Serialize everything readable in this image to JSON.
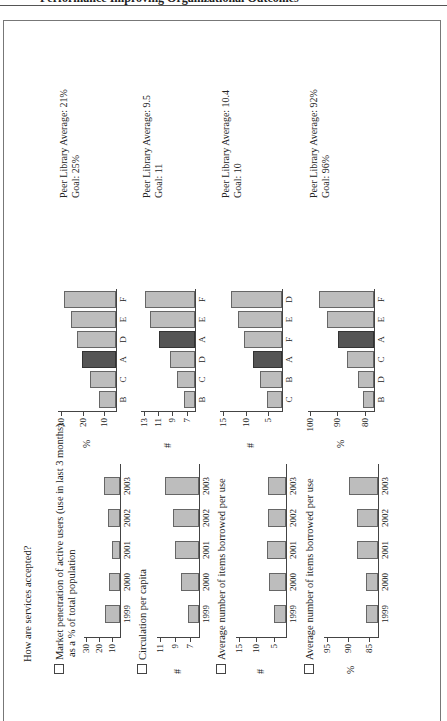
{
  "page_header": {
    "text": "Performance Improving Organizational Outcomes"
  },
  "figure": {
    "title": "How are services accepted?",
    "rows": [
      {
        "question": "Market penetration of active users (use in last 3 months)",
        "question_sub": "as a % of total population",
        "trend": {
          "unit": "",
          "ticks": [
            "30",
            "20",
            "10"
          ],
          "ymin": 5,
          "ymax": 32,
          "categories": [
            "1999",
            "2000",
            "2001",
            "2002",
            "2003"
          ],
          "values": [
            16,
            13,
            11,
            14,
            17
          ]
        },
        "peer": {
          "unit": "%",
          "ticks": [
            "30",
            "20",
            "10"
          ],
          "ymin": 5,
          "ymax": 32,
          "categories": [
            "B",
            "C",
            "A",
            "D",
            "E",
            "F"
          ],
          "values": [
            13,
            17,
            21,
            23,
            26,
            29
          ],
          "highlight": "A"
        },
        "peer_text": "Peer Library Average: 21%",
        "goal_text": "Goal: 25%"
      },
      {
        "question": "Circulation per capita",
        "question_sub": "",
        "trend": {
          "unit": "#",
          "ticks": [
            "11",
            "9",
            "7"
          ],
          "ymin": 6,
          "ymax": 11.5,
          "categories": [
            "1999",
            "2000",
            "2001",
            "2002",
            "2003"
          ],
          "values": [
            7.5,
            8.3,
            9.2,
            9.4,
            10.5
          ]
        },
        "peer": {
          "unit": "#",
          "ticks": [
            "13",
            "11",
            "9",
            "7"
          ],
          "ymin": 6,
          "ymax": 13.5,
          "categories": [
            "B",
            "C",
            "D",
            "A",
            "E",
            "F"
          ],
          "values": [
            7.5,
            8.5,
            9.5,
            11,
            12.3,
            13
          ]
        },
        "peer_text": "Peer Library Average: 9.5",
        "goal_text": "Goal: 11"
      },
      {
        "question": "Average number of items borrowed per use",
        "question_sub": "",
        "trend": {
          "unit": "#",
          "ticks": [
            "15",
            "10",
            "5"
          ],
          "ymin": 2,
          "ymax": 16,
          "categories": [
            "1999",
            "2000",
            "2001",
            "2002",
            "2003"
          ],
          "values": [
            5.5,
            6.8,
            7.2,
            7.1,
            7.0
          ]
        },
        "peer": {
          "unit": "#",
          "ticks": [
            "15",
            "10",
            "5"
          ],
          "ymin": 2,
          "ymax": 16,
          "categories": [
            "C",
            "B",
            "A",
            "F",
            "E",
            "D"
          ],
          "values": [
            5.5,
            7,
            8.5,
            10.5,
            12,
            13.5
          ]
        },
        "peer_text": "Peer Library Average: 10.4",
        "goal_text": "Goal: 10"
      },
      {
        "question": "Average number of items borrowed per use",
        "question_sub": "",
        "trend": {
          "unit": "%",
          "ticks": [
            "95",
            "90",
            "85"
          ],
          "ymin": 83,
          "ymax": 96,
          "categories": [
            "1999",
            "2000",
            "2001",
            "2002",
            "2003"
          ],
          "values": [
            86,
            86,
            88,
            88,
            90
          ]
        },
        "peer": {
          "unit": "%",
          "ticks": [
            "100",
            "90",
            "80"
          ],
          "ymin": 77,
          "ymax": 101,
          "categories": [
            "B",
            "D",
            "C",
            "A",
            "E",
            "F"
          ],
          "values": [
            81,
            83,
            87,
            90,
            94,
            97
          ]
        },
        "peer_text": "Peer Library Average: 92%",
        "goal_text": "Goal: 96%"
      }
    ]
  },
  "chart_data": [
    {
      "type": "bar",
      "title": "Market penetration of active users (use in last 3 months) as a % of total population — trend",
      "categories": [
        "1999",
        "2000",
        "2001",
        "2002",
        "2003"
      ],
      "values": [
        16,
        13,
        11,
        14,
        17
      ],
      "ylabel": "",
      "yticks": [
        10,
        20,
        30
      ]
    },
    {
      "type": "bar",
      "title": "Market penetration — peer comparison",
      "categories": [
        "B",
        "C",
        "A",
        "D",
        "E",
        "F"
      ],
      "values": [
        13,
        17,
        21,
        23,
        26,
        29
      ],
      "ylabel": "%",
      "yticks": [
        10,
        20,
        30
      ],
      "highlight": "A",
      "annotation": "Peer Library Average: 21%; Goal: 25%"
    },
    {
      "type": "bar",
      "title": "Circulation per capita — trend",
      "categories": [
        "1999",
        "2000",
        "2001",
        "2002",
        "2003"
      ],
      "values": [
        7.5,
        8.3,
        9.2,
        9.4,
        10.5
      ],
      "ylabel": "#",
      "yticks": [
        7,
        9,
        11
      ]
    },
    {
      "type": "bar",
      "title": "Circulation per capita — peer comparison",
      "categories": [
        "B",
        "C",
        "D",
        "A",
        "E",
        "F"
      ],
      "values": [
        7.5,
        8.5,
        9.5,
        11,
        12.3,
        13
      ],
      "ylabel": "#",
      "yticks": [
        7,
        9,
        11,
        13
      ],
      "highlight": "A",
      "annotation": "Peer Library Average: 9.5; Goal: 11"
    },
    {
      "type": "bar",
      "title": "Average number of items borrowed per use — trend",
      "categories": [
        "1999",
        "2000",
        "2001",
        "2002",
        "2003"
      ],
      "values": [
        5.5,
        6.8,
        7.2,
        7.1,
        7.0
      ],
      "ylabel": "#",
      "yticks": [
        5,
        10,
        15
      ]
    },
    {
      "type": "bar",
      "title": "Average number of items borrowed per use — peer comparison",
      "categories": [
        "C",
        "B",
        "A",
        "F",
        "E",
        "D"
      ],
      "values": [
        5.5,
        7,
        8.5,
        10.5,
        12,
        13.5
      ],
      "ylabel": "#",
      "yticks": [
        5,
        10,
        15
      ],
      "highlight": "A",
      "annotation": "Peer Library Average: 10.4; Goal: 10"
    },
    {
      "type": "bar",
      "title": "Average number of items borrowed per use (%) — trend",
      "categories": [
        "1999",
        "2000",
        "2001",
        "2002",
        "2003"
      ],
      "values": [
        86,
        86,
        88,
        88,
        90
      ],
      "ylabel": "%",
      "yticks": [
        85,
        90,
        95
      ]
    },
    {
      "type": "bar",
      "title": "Average number of items borrowed per use (%) — peer comparison",
      "categories": [
        "B",
        "D",
        "C",
        "A",
        "E",
        "F"
      ],
      "values": [
        81,
        83,
        87,
        90,
        94,
        97
      ],
      "ylabel": "%",
      "yticks": [
        80,
        90,
        100
      ],
      "highlight": "A",
      "annotation": "Peer Library Average: 92%; Goal: 96%"
    }
  ]
}
